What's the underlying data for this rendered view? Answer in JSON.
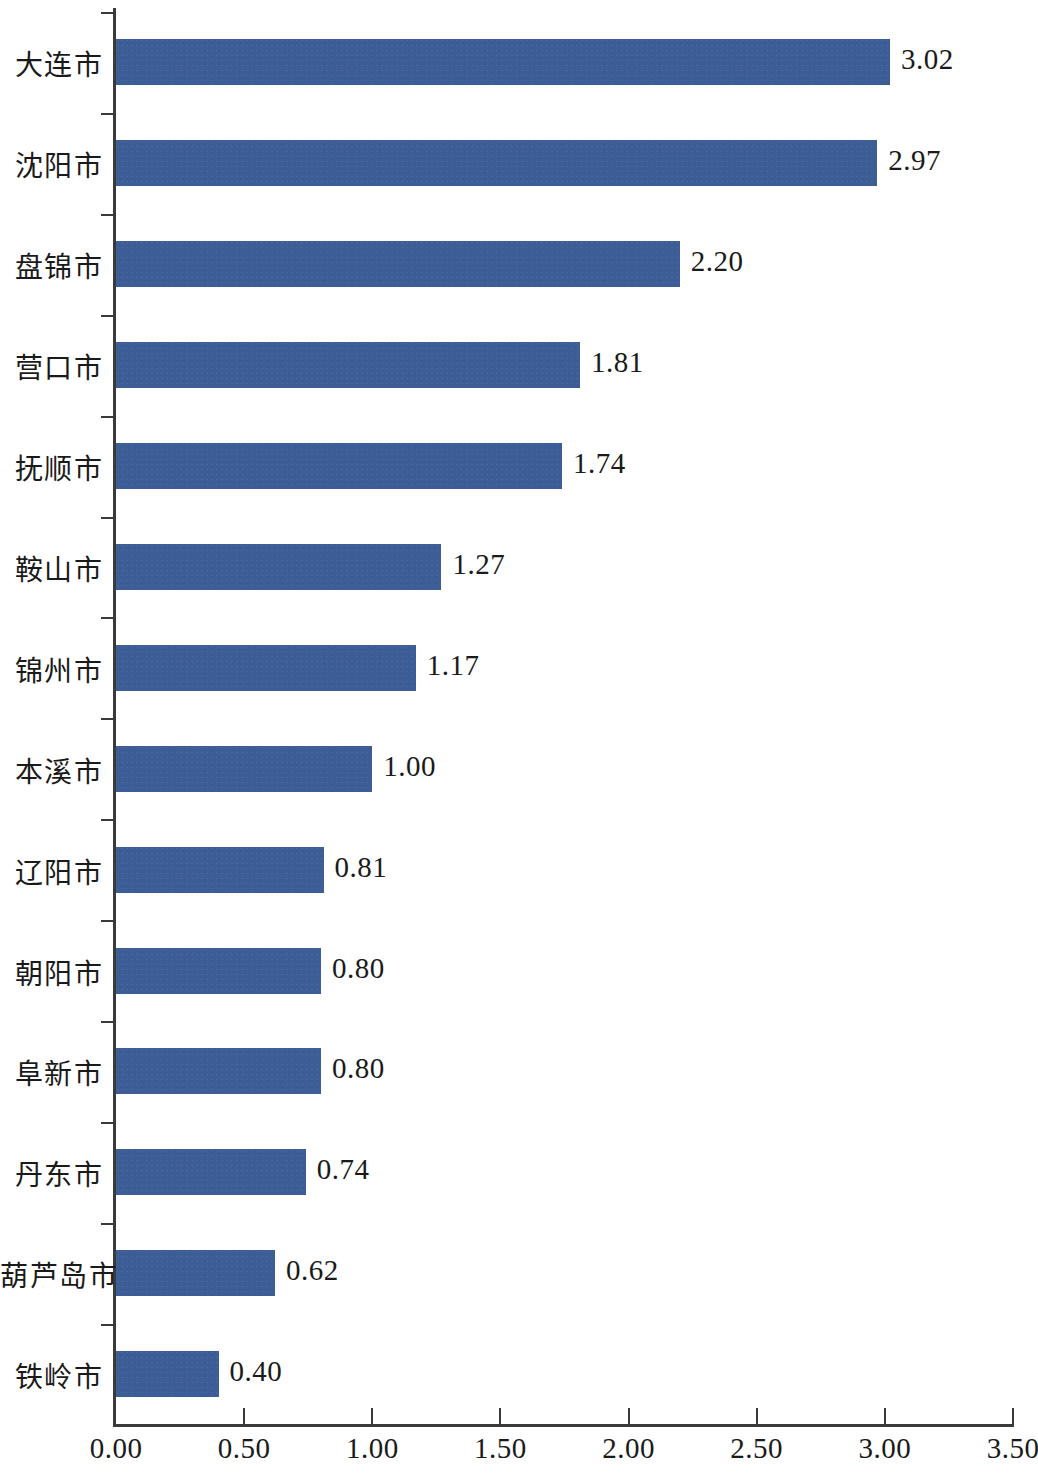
{
  "chart_data": {
    "type": "bar",
    "orientation": "horizontal",
    "title": "",
    "xlabel": "",
    "ylabel": "",
    "xlim": [
      0.0,
      3.5
    ],
    "xticks": [
      "0.00",
      "0.50",
      "1.00",
      "1.50",
      "2.00",
      "2.50",
      "3.00",
      "3.50"
    ],
    "xtick_values": [
      0.0,
      0.5,
      1.0,
      1.5,
      2.0,
      2.5,
      3.0,
      3.5
    ],
    "grid": false,
    "legend": null,
    "bar_color": "#3c5d96",
    "axis_color": "#3a3a3a",
    "text_color": "#1a1a1a",
    "categories": [
      "大连市",
      "沈阳市",
      "盘锦市",
      "营口市",
      "抚顺市",
      "鞍山市",
      "锦州市",
      "本溪市",
      "辽阳市",
      "朝阳市",
      "阜新市",
      "丹东市",
      "葫芦岛市",
      "铁岭市"
    ],
    "values": [
      3.02,
      2.97,
      2.2,
      1.81,
      1.74,
      1.27,
      1.17,
      1.0,
      0.81,
      0.8,
      0.8,
      0.74,
      0.62,
      0.4
    ],
    "value_labels": [
      "3.02",
      "2.97",
      "2.20",
      "1.81",
      "1.74",
      "1.27",
      "1.17",
      "1.00",
      "0.81",
      "0.80",
      "0.80",
      "0.74",
      "0.62",
      "0.40"
    ]
  }
}
